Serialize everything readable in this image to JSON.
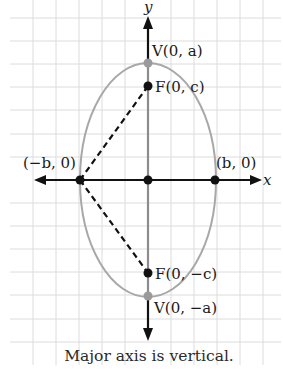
{
  "figure": {
    "caption": "Major axis is vertical.",
    "axes": {
      "x_label": "x",
      "y_label": "y"
    },
    "points": {
      "top_vertex": {
        "name": "V",
        "coords": "(0, a)"
      },
      "top_focus": {
        "name": "F",
        "coords": "(0, c)"
      },
      "left_vertex": {
        "coords": "(−b, 0)"
      },
      "right_vertex": {
        "coords": "(b, 0)"
      },
      "bottom_focus": {
        "name": "F",
        "coords": "(0, −c)"
      },
      "bottom_vertex": {
        "name": "V",
        "coords": "(0, −a)"
      }
    },
    "labels": {
      "top_vertex": "V(0, a)",
      "top_focus": "F(0, c)",
      "left_vertex": "(−b, 0)",
      "right_vertex": "(b, 0)",
      "bottom_focus": "F(0, −c)",
      "bottom_vertex": "V(0, −a)"
    },
    "colors": {
      "grid": "#d9d9d9",
      "ellipse": "#a6a6a6",
      "axis": "#111111",
      "major_axis_segment": "#8c8c8c",
      "vertex_point": "#9a9a9a",
      "focus_point": "#111111",
      "dashed_lines": "#111111"
    }
  }
}
